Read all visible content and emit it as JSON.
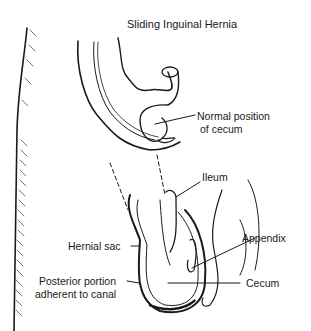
{
  "title": "Sliding Inguinal Hernia",
  "labels": {
    "normal_position_line1": "Normal position",
    "normal_position_line2": "of cecum",
    "ileum": "Ileum",
    "hernial_sac": "Hernial sac",
    "appendix": "Appendix",
    "posterior_line1": "Posterior portion",
    "posterior_line2": "adherent to canal",
    "cecum": "Cecum"
  },
  "colors": {
    "ink": "#1a1a1a",
    "background": "#ffffff"
  }
}
